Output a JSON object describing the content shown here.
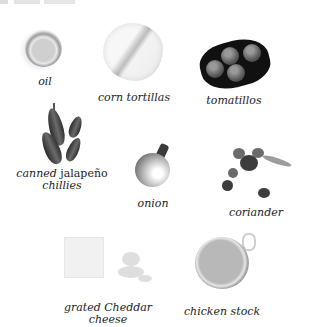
{
  "page": {
    "top_edge_text": ""
  },
  "ingredients": [
    {
      "name": "oil",
      "label": "oil"
    },
    {
      "name": "corn-tortillas",
      "label": "corn tortillas"
    },
    {
      "name": "tomatillos",
      "label": "tomatillos"
    },
    {
      "name": "canned-jalapeno-chillies",
      "label_italic_1": "canned",
      "label_roman": "jalapeño",
      "label_italic_2": "chillies"
    },
    {
      "name": "onion",
      "label": "onion"
    },
    {
      "name": "coriander",
      "label": "coriander"
    },
    {
      "name": "grated-cheddar-cheese",
      "label_line1": "grated Cheddar",
      "label_line2": "cheese"
    },
    {
      "name": "chicken-stock",
      "label": "chicken stock"
    }
  ]
}
